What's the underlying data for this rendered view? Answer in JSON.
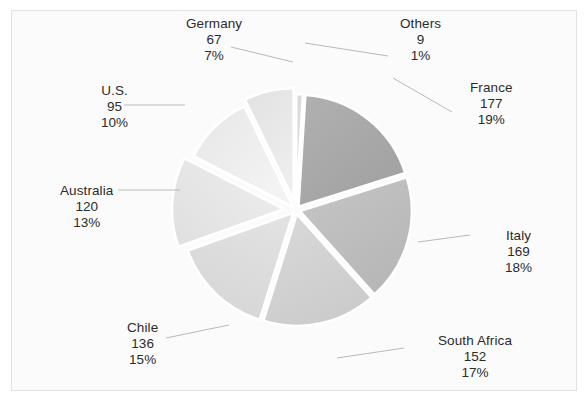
{
  "chart_data": {
    "type": "pie",
    "title": "",
    "subtitle": "",
    "xlabel": "",
    "ylabel": "",
    "legend_position": "none",
    "grid": false,
    "total": 925,
    "categories": [
      "Others",
      "France",
      "Italy",
      "South Africa",
      "Chile",
      "Australia",
      "U.S.",
      "Germany"
    ],
    "values": [
      9,
      177,
      169,
      152,
      136,
      120,
      95,
      67
    ],
    "percent_labels": [
      "1%",
      "19%",
      "18%",
      "17%",
      "15%",
      "13%",
      "10%",
      "7%"
    ],
    "percents": [
      1,
      19,
      18,
      17,
      15,
      13,
      10,
      7
    ],
    "slice_colors": [
      "#d9d9d9",
      "#a9a9a9",
      "#bdbdbd",
      "#d2d2d2",
      "#dcdcdc",
      "#e6e6e6",
      "#efefef",
      "#e9e9e9"
    ],
    "exploded": true,
    "separator_color": "#ffffff",
    "start_angle_deg": -90,
    "slices": [
      {
        "name": "Others",
        "value": "9",
        "percent": "1%",
        "color": "#d9d9d9",
        "start_deg": -90.0,
        "end_deg": -86.5,
        "explode": 4,
        "label_x": 400,
        "label_y": 16,
        "leader": {
          "x1": 388,
          "y1": 56,
          "x2": 305,
          "y2": 43
        }
      },
      {
        "name": "France",
        "value": "177",
        "percent": "19%",
        "color": "#a9a9a9",
        "start_deg": -86.5,
        "end_deg": -17.6,
        "explode": 4,
        "label_x": 470,
        "label_y": 80,
        "leader": {
          "x1": 393,
          "y1": 78,
          "x2": 452,
          "y2": 112
        }
      },
      {
        "name": "Italy",
        "value": "169",
        "percent": "18%",
        "color": "#bdbdbd",
        "start_deg": -17.6,
        "end_deg": 48.2,
        "explode": 4,
        "label_x": 505,
        "label_y": 228,
        "leader": {
          "x1": 418,
          "y1": 242,
          "x2": 470,
          "y2": 235
        }
      },
      {
        "name": "South Africa",
        "value": "152",
        "percent": "17%",
        "color": "#d2d2d2",
        "start_deg": 48.2,
        "end_deg": 107.4,
        "explode": 4,
        "label_x": 438,
        "label_y": 333,
        "leader": {
          "x1": 337,
          "y1": 358,
          "x2": 404,
          "y2": 348
        }
      },
      {
        "name": "Chile",
        "value": "136",
        "percent": "15%",
        "color": "#dcdcdc",
        "start_deg": 107.4,
        "end_deg": 160.4,
        "explode": 4,
        "label_x": 127,
        "label_y": 320,
        "leader": {
          "x1": 229,
          "y1": 325,
          "x2": 166,
          "y2": 338
        }
      },
      {
        "name": "Australia",
        "value": "120",
        "percent": "13%",
        "color": "#e6e6e6",
        "start_deg": 160.4,
        "end_deg": 207.1,
        "explode": 12,
        "label_x": 60,
        "label_y": 183,
        "leader": {
          "x1": 180,
          "y1": 190,
          "x2": 118,
          "y2": 190
        }
      },
      {
        "name": "U.S.",
        "value": "95",
        "percent": "10%",
        "color": "#efefef",
        "start_deg": 207.1,
        "end_deg": 244.1,
        "explode": 4,
        "label_x": 101,
        "label_y": 83,
        "leader": {
          "x1": 185,
          "y1": 105,
          "x2": 124,
          "y2": 105
        }
      },
      {
        "name": "Germany",
        "value": "67",
        "percent": "7%",
        "color": "#e9e9e9",
        "start_deg": 244.1,
        "end_deg": 270.0,
        "explode": 10,
        "label_x": 186,
        "label_y": 16,
        "leader": {
          "x1": 231,
          "y1": 47,
          "x2": 293,
          "y2": 62
        }
      }
    ],
    "geometry": {
      "center_x": 296,
      "center_y": 210,
      "radius": 112
    }
  },
  "frame": {
    "border_color": "#e2e2e2",
    "background": "#fbfbfb"
  }
}
